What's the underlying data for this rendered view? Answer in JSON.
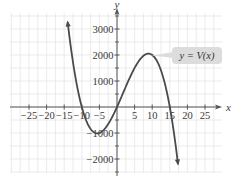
{
  "chart_data": {
    "type": "line",
    "title": "",
    "xlabel": "x",
    "ylabel": "y",
    "xlim": [
      -28,
      29
    ],
    "ylim": [
      -2600,
      3600
    ],
    "grid": true,
    "x_ticks": [
      -25,
      -20,
      -15,
      -10,
      -5,
      5,
      10,
      15,
      20,
      25
    ],
    "x_tick_labels": [
      "−25",
      "−20",
      "−15",
      "−10",
      "−5",
      "5",
      "10",
      "15",
      "20",
      "25"
    ],
    "y_ticks": [
      -2000,
      -1000,
      1000,
      2000,
      3000
    ],
    "y_tick_labels": [
      "−2000",
      "−1000",
      "1000",
      "2000",
      "3000"
    ],
    "series": [
      {
        "name": "y = V(x)",
        "function": "V(x) = -2x^3 + 10x^2 + 300x",
        "x": [
          -14,
          -12,
          -10,
          -8,
          -6,
          -5,
          -4,
          -2,
          0,
          2,
          4,
          6,
          8,
          9,
          10,
          12,
          14,
          15,
          16,
          17.3
        ],
        "values": [
          3248,
          1392,
          0,
          -896,
          -1080,
          -1000,
          -832,
          -344,
          0,
          624,
          1232,
          1728,
          2016,
          2052,
          2000,
          1584,
          672,
          0,
          -832,
          -2106
        ],
        "color": "#4a4a4a",
        "arrows": "both-ends"
      }
    ],
    "annotations": [
      {
        "text": "y = V(x)",
        "points_to": [
          9.5,
          2050
        ],
        "style": "rounded-callout"
      }
    ],
    "x_intercepts": [
      -10,
      0,
      15
    ],
    "local_max": [
      9,
      2052
    ],
    "local_min": [
      -5,
      -1000
    ]
  },
  "labels": {
    "x_axis": "x",
    "y_axis": "y",
    "callout_prefix": "y = ",
    "callout_func": "V(x)"
  }
}
